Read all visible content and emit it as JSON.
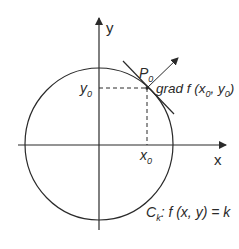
{
  "diagram": {
    "type": "level-curve-gradient",
    "colors": {
      "stroke": "#2a2a2a",
      "background": "#ffffff"
    },
    "axes": {
      "x_label": "x",
      "y_label": "y"
    },
    "point": {
      "label_main": "P",
      "label_sub": "0"
    },
    "coordinates": {
      "x0_main": "x",
      "x0_sub": "0",
      "y0_main": "y",
      "y0_sub": "0"
    },
    "gradient_label": {
      "prefix": "grad f (x",
      "sub1": "0",
      "mid": ", y",
      "sub2": "0",
      "suffix": ")"
    },
    "curve_label": {
      "main": "C",
      "sub": "k",
      "rest": ": f (x, y) = k"
    }
  }
}
